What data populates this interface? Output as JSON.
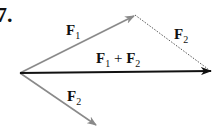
{
  "figure": {
    "problem_number": "7.",
    "labels": {
      "f1": "F",
      "f1_sub": "1",
      "f2_dotted": "F",
      "f2_dotted_sub": "2",
      "sum_a": "F",
      "sum_a_sub": "1",
      "sum_plus": " + ",
      "sum_b": "F",
      "sum_b_sub": "2",
      "f2_lower": "F",
      "f2_lower_sub": "2"
    },
    "colors": {
      "component_arrow": "#8a8a8a",
      "resultant_arrow": "#111111",
      "dotted_line": "#555555"
    },
    "vectors": [
      {
        "name": "F1",
        "from": [
          20,
          73
        ],
        "to": [
          135,
          15
        ]
      },
      {
        "name": "F2",
        "from": [
          20,
          73
        ],
        "to": [
          97,
          126
        ]
      },
      {
        "name": "F1+F2",
        "from": [
          20,
          73
        ],
        "to": [
          211,
          71
        ]
      },
      {
        "name": "F2 translated",
        "from": [
          135,
          15
        ],
        "to": [
          211,
          71
        ],
        "style": "dotted"
      }
    ]
  }
}
